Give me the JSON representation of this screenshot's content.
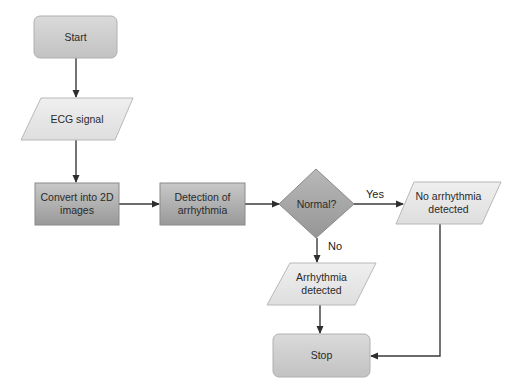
{
  "diagram": {
    "type": "flowchart",
    "nodes": {
      "start": {
        "shape": "rounded-rect",
        "label": "Start"
      },
      "ecg": {
        "shape": "parallelogram",
        "label": "ECG signal"
      },
      "convert": {
        "shape": "rect",
        "line1": "Convert into 2D",
        "line2": "images"
      },
      "detection": {
        "shape": "rect",
        "line1": "Detection of",
        "line2": "arrhythmia"
      },
      "normal": {
        "shape": "diamond",
        "label": "Normal?"
      },
      "no_arr": {
        "shape": "parallelogram",
        "line1": "No arrhythmia",
        "line2": "detected"
      },
      "arr": {
        "shape": "parallelogram",
        "line1": "Arrhythmia",
        "line2": "detected"
      },
      "stop": {
        "shape": "rounded-rect",
        "label": "Stop"
      }
    },
    "edges": {
      "yes_label": "Yes",
      "no_label": "No"
    },
    "colors": {
      "terminal_fill": "#d2d2d2",
      "io_fill": "#e8e8e8",
      "process_top": "#c4c4c4",
      "process_bottom": "#9c9c9c",
      "decision_fill": "#a8a8a8",
      "line": "#3a3a3a"
    }
  }
}
